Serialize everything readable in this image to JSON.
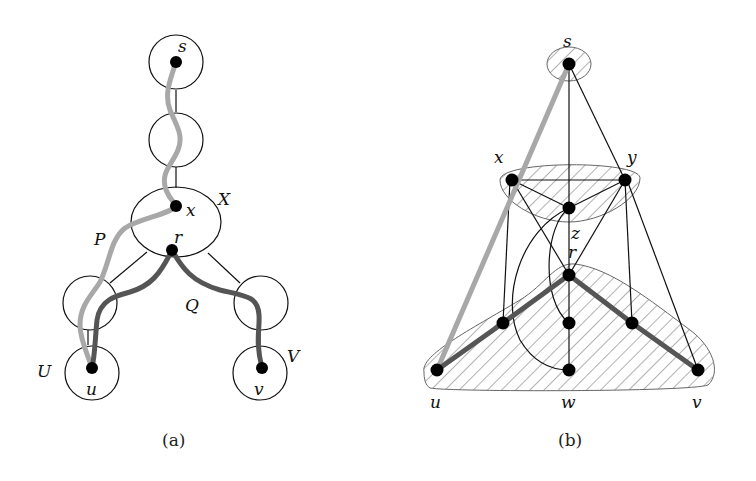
{
  "figure": {
    "panel_a": {
      "caption": "(a)",
      "labels": {
        "s": "s",
        "x": "x",
        "r": "r",
        "u": "u",
        "v": "v",
        "X": "X",
        "P": "P",
        "Q": "Q",
        "U": "U",
        "V": "V"
      },
      "paths": [
        {
          "name": "P",
          "from": "s",
          "to": "u",
          "color": "#a8a8a8"
        },
        {
          "name": "Q",
          "from": "u",
          "via": "r",
          "to": "v",
          "color": "#555555"
        }
      ]
    },
    "panel_b": {
      "caption": "(b)",
      "labels": {
        "s": "s",
        "x": "x",
        "y": "y",
        "z": "z",
        "r": "r",
        "u": "u",
        "w": "w",
        "v": "v"
      },
      "paths": [
        {
          "from": "s",
          "to": "u",
          "color": "#a8a8a8"
        },
        {
          "from": "u",
          "via": "r",
          "to": "v",
          "color": "#555555"
        }
      ]
    },
    "colors": {
      "node": "#000000",
      "edge": "#111111",
      "light_path": "#a8a8a8",
      "dark_path": "#555555",
      "hatch": "#666666"
    }
  }
}
